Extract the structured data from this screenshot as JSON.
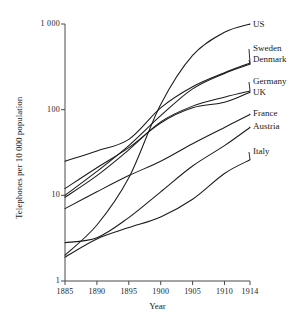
{
  "chart_data": {
    "type": "line",
    "title": "",
    "xlabel": "Year",
    "ylabel": "Telephones per 10 000 population",
    "yscale": "log",
    "ylim": [
      1,
      1000
    ],
    "xlim": [
      1885,
      1914
    ],
    "grid": false,
    "legend_position": "right-inline-labels",
    "ytick_labels": [
      "1 000",
      "100",
      "10",
      "1"
    ],
    "ytick_values": [
      1000,
      100,
      10,
      1
    ],
    "xtick_labels": [
      "1885",
      "1890",
      "1895",
      "1900",
      "1905",
      "1910",
      "1914"
    ],
    "xtick_values": [
      1885,
      1890,
      1895,
      1900,
      1905,
      1910,
      1914
    ],
    "x": [
      1885,
      1890,
      1895,
      1900,
      1905,
      1910,
      1914
    ],
    "series": [
      {
        "name": "US",
        "label": "US",
        "values": [
          2.0,
          4.5,
          16.0,
          115.0,
          430.0,
          800.0,
          1000.0
        ]
      },
      {
        "name": "Sweden",
        "label": "Sweden",
        "values": [
          25.0,
          33.0,
          45.0,
          105.0,
          185.0,
          270.0,
          350.0
        ]
      },
      {
        "name": "Denmark",
        "label": "Denmark",
        "values": [
          10.0,
          19.0,
          38.0,
          85.0,
          175.0,
          265.0,
          340.0
        ]
      },
      {
        "name": "Germany",
        "label": "Germany",
        "values": [
          9.5,
          17.0,
          34.0,
          72.0,
          110.0,
          140.0,
          165.0
        ]
      },
      {
        "name": "UK",
        "label": "UK",
        "values": [
          12.0,
          21.0,
          36.0,
          70.0,
          105.0,
          122.0,
          160.0
        ]
      },
      {
        "name": "France",
        "label": "France",
        "values": [
          7.0,
          11.0,
          17.0,
          25.0,
          40.0,
          62.0,
          88.0
        ]
      },
      {
        "name": "Austria",
        "label": "Austria",
        "values": [
          2.8,
          3.2,
          5.5,
          11.0,
          22.0,
          38.0,
          62.0
        ]
      },
      {
        "name": "Italy",
        "label": "Italy",
        "values": [
          1.9,
          3.1,
          4.2,
          5.6,
          9.0,
          18.0,
          26.0
        ]
      }
    ]
  },
  "axes": {
    "x_title": "Year",
    "y_title": "Telephones per 10 000 population"
  }
}
